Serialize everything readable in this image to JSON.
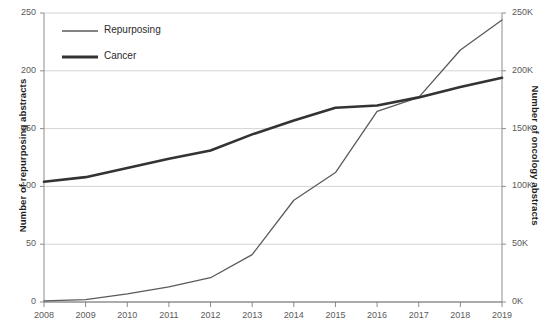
{
  "chart_data": {
    "type": "line",
    "title": "",
    "xlabel": "",
    "categories": [
      "2008",
      "2009",
      "2010",
      "2011",
      "2012",
      "2013",
      "2014",
      "2015",
      "2016",
      "2017",
      "2018",
      "2019"
    ],
    "grid": true,
    "legend_position": "top-left",
    "series": [
      {
        "name": "Repurposing",
        "axis": "left",
        "color": "#5a5a5a",
        "stroke_width": 1.3,
        "values": [
          1,
          2,
          7,
          13,
          21,
          41,
          88,
          112,
          165,
          177,
          218,
          244
        ]
      },
      {
        "name": "Cancer",
        "axis": "right",
        "color": "#333333",
        "stroke_width": 2.6,
        "values": [
          104000,
          108000,
          116000,
          124000,
          131000,
          145000,
          157000,
          168000,
          170000,
          177000,
          186000,
          194000
        ]
      }
    ],
    "left_axis": {
      "label": "Number of repurposing abstracts",
      "ticks": [
        0,
        50,
        100,
        150,
        200,
        250
      ],
      "tick_labels": [
        "0",
        "50",
        "100",
        "150",
        "200",
        "250"
      ],
      "ylim": [
        0,
        250
      ]
    },
    "right_axis": {
      "label": "Number of oncology abstracts",
      "ticks": [
        0,
        50000,
        100000,
        150000,
        200000,
        250000
      ],
      "tick_labels": [
        "0K",
        "50K",
        "100K",
        "150K",
        "200K",
        "250K"
      ],
      "ylim": [
        0,
        250000
      ]
    },
    "legend": [
      {
        "label": "Repurposing",
        "color": "#5a5a5a",
        "stroke_width": 1.4
      },
      {
        "label": "Cancer",
        "color": "#333333",
        "stroke_width": 3.0
      }
    ]
  }
}
